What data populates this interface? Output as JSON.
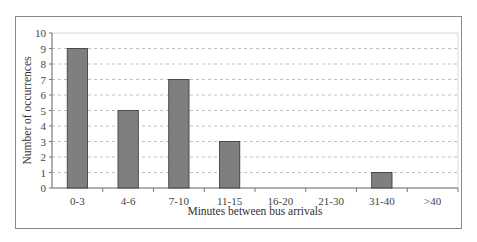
{
  "chart_data": {
    "type": "bar",
    "title": "",
    "xlabel": "Minutes between bus arrivals",
    "ylabel": "Number of occurrences",
    "categories": [
      "0-3",
      "4-6",
      "7-10",
      "11-15",
      "16-20",
      "21-30",
      "31-40",
      ">40"
    ],
    "values": [
      9,
      5,
      7,
      3,
      0,
      0,
      1,
      0
    ],
    "ylim": [
      0,
      10
    ],
    "yticks": [
      0,
      1,
      2,
      3,
      4,
      5,
      6,
      7,
      8,
      9,
      10
    ],
    "grid": "horizontal dashed",
    "legend": "none",
    "bar_color": "#7f7f7f",
    "bar_edge_color": "#333333"
  }
}
